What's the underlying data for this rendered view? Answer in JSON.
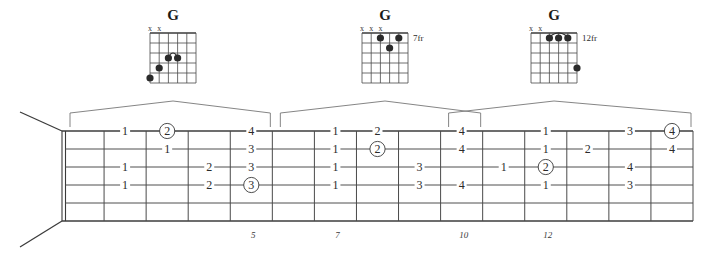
{
  "chord_diagrams": [
    {
      "name": "G",
      "fret_label": "",
      "muted_strings": [
        "x",
        "x"
      ],
      "muted_positions": [
        0,
        1
      ],
      "dots": [
        {
          "string": 4,
          "fret": 3
        },
        {
          "string": 3,
          "fret": 3
        },
        {
          "string": 2,
          "fret": 4
        },
        {
          "string": 1,
          "fret": 5
        }
      ],
      "arc": {
        "from_string": 4,
        "to_string": 3,
        "fret": 3
      }
    },
    {
      "name": "G",
      "fret_label": "7fr",
      "muted_strings": [
        "x",
        "x",
        "x"
      ],
      "muted_positions": [
        0,
        1,
        2
      ],
      "dots": [
        {
          "string": 3,
          "fret": 1
        },
        {
          "string": 5,
          "fret": 1
        },
        {
          "string": 4,
          "fret": 2
        }
      ],
      "arc": null
    },
    {
      "name": "G",
      "fret_label": "12fr",
      "muted_strings": [
        "x",
        "x"
      ],
      "muted_positions": [
        0,
        1
      ],
      "dots": [
        {
          "string": 3,
          "fret": 1
        },
        {
          "string": 4,
          "fret": 1
        },
        {
          "string": 5,
          "fret": 1
        },
        {
          "string": 6,
          "fret": 4
        }
      ],
      "arc": {
        "from_string": 3,
        "to_string": 5,
        "fret": 1
      }
    }
  ],
  "fretboard": {
    "position_markers": [
      {
        "label": "5",
        "fret": 5
      },
      {
        "label": "7",
        "fret": 7
      },
      {
        "label": "10",
        "fret": 10
      },
      {
        "label": "12",
        "fret": 12
      }
    ],
    "fingerings": [
      {
        "string": 1,
        "fret": 2,
        "label": "1",
        "circled": false
      },
      {
        "string": 3,
        "fret": 2,
        "label": "1",
        "circled": false
      },
      {
        "string": 4,
        "fret": 2,
        "label": "1",
        "circled": false
      },
      {
        "string": 1,
        "fret": 3,
        "label": "2",
        "circled": true
      },
      {
        "string": 2,
        "fret": 3,
        "label": "1",
        "circled": false
      },
      {
        "string": 3,
        "fret": 4,
        "label": "2",
        "circled": false
      },
      {
        "string": 4,
        "fret": 4,
        "label": "2",
        "circled": false
      },
      {
        "string": 1,
        "fret": 5,
        "label": "4",
        "circled": false
      },
      {
        "string": 2,
        "fret": 5,
        "label": "3",
        "circled": false
      },
      {
        "string": 3,
        "fret": 5,
        "label": "3",
        "circled": false
      },
      {
        "string": 4,
        "fret": 5,
        "label": "3",
        "circled": true
      },
      {
        "string": 1,
        "fret": 7,
        "label": "1",
        "circled": false
      },
      {
        "string": 2,
        "fret": 7,
        "label": "1",
        "circled": false
      },
      {
        "string": 3,
        "fret": 7,
        "label": "1",
        "circled": false
      },
      {
        "string": 4,
        "fret": 7,
        "label": "1",
        "circled": false
      },
      {
        "string": 1,
        "fret": 8,
        "label": "2",
        "circled": false
      },
      {
        "string": 2,
        "fret": 8,
        "label": "2",
        "circled": true
      },
      {
        "string": 3,
        "fret": 9,
        "label": "3",
        "circled": false
      },
      {
        "string": 4,
        "fret": 9,
        "label": "3",
        "circled": false
      },
      {
        "string": 1,
        "fret": 10,
        "label": "4",
        "circled": false
      },
      {
        "string": 2,
        "fret": 10,
        "label": "4",
        "circled": false
      },
      {
        "string": 4,
        "fret": 10,
        "label": "4",
        "circled": false
      },
      {
        "string": 3,
        "fret": 11,
        "label": "1",
        "circled": false
      },
      {
        "string": 1,
        "fret": 12,
        "label": "1",
        "circled": false
      },
      {
        "string": 2,
        "fret": 12,
        "label": "1",
        "circled": false
      },
      {
        "string": 3,
        "fret": 12,
        "label": "2",
        "circled": true
      },
      {
        "string": 4,
        "fret": 12,
        "label": "1",
        "circled": false
      },
      {
        "string": 2,
        "fret": 13,
        "label": "2",
        "circled": false
      },
      {
        "string": 1,
        "fret": 14,
        "label": "3",
        "circled": false
      },
      {
        "string": 3,
        "fret": 14,
        "label": "4",
        "circled": false
      },
      {
        "string": 4,
        "fret": 14,
        "label": "3",
        "circled": false
      },
      {
        "string": 1,
        "fret": 15,
        "label": "4",
        "circled": true
      },
      {
        "string": 2,
        "fret": 15,
        "label": "4",
        "circled": false
      }
    ]
  },
  "colors": {
    "ink": "#2b2b2b",
    "line": "#4a4a4a",
    "bracket": "#777777",
    "background": "#ffffff"
  }
}
